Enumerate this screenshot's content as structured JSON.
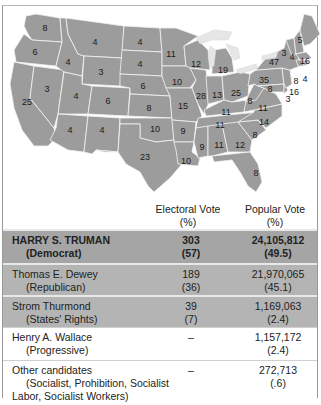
{
  "map": {
    "state_fill": "#9c9c9c",
    "border_color": "#f2f2f2",
    "electoral_votes": {
      "WA": "8",
      "OR": "6",
      "CA": "25",
      "ID": "4",
      "NV": "3",
      "MT": "4",
      "WY": "3",
      "UT": "4",
      "AZ": "4",
      "CO": "6",
      "NM": "4",
      "ND": "4",
      "SD": "4",
      "NE": "6",
      "KS": "8",
      "OK": "10",
      "TX": "23",
      "MN": "11",
      "IA": "10",
      "MO": "15",
      "AR": "9",
      "LA": "10",
      "WI": "12",
      "IL": "28",
      "MI": "19",
      "IN": "13",
      "OH": "25",
      "KY": "11",
      "TN": "11",
      "MS": "9",
      "AL": "11",
      "GA": "12",
      "FL": "8",
      "SC": "8",
      "NC": "14",
      "VA": "11",
      "WV": "8",
      "PA": "35",
      "NY": "47",
      "VT": "3",
      "NH": "4",
      "ME": "5",
      "MA": "16",
      "RI": "4",
      "CT": "8",
      "NJ": "16",
      "DE": "3",
      "MD": "8"
    }
  },
  "table": {
    "headers": {
      "electoral": "Electoral Vote",
      "electoral_unit": "(%)",
      "popular": "Popular Vote",
      "popular_unit": "(%)"
    },
    "rows": [
      {
        "name": "HARRY S. TRUMAN",
        "party": "(Democrat)",
        "electoral": "303",
        "electoral_pct": "(57)",
        "popular": "24,105,812",
        "popular_pct": "(49.5)"
      },
      {
        "name": "Thomas E. Dewey",
        "party": "(Republican)",
        "electoral": "189",
        "electoral_pct": "(36)",
        "popular": "21,970,065",
        "popular_pct": "(45.1)"
      },
      {
        "name": "Strom Thurmond",
        "party": "(States' Rights)",
        "electoral": "39",
        "electoral_pct": "(7)",
        "popular": "1,169,063",
        "popular_pct": "(2.4)"
      },
      {
        "name": "Henry A. Wallace",
        "party": "(Progressive)",
        "electoral": "–",
        "electoral_pct": "",
        "popular": "1,157,172",
        "popular_pct": "(2.4)"
      },
      {
        "name": "Other candidates",
        "party": "(Socialist, Prohibition, Socialist",
        "party_line2": "Labor, Socialist Workers)",
        "electoral": "–",
        "electoral_pct": "",
        "popular": "272,713",
        "popular_pct": "(.6)"
      }
    ]
  }
}
